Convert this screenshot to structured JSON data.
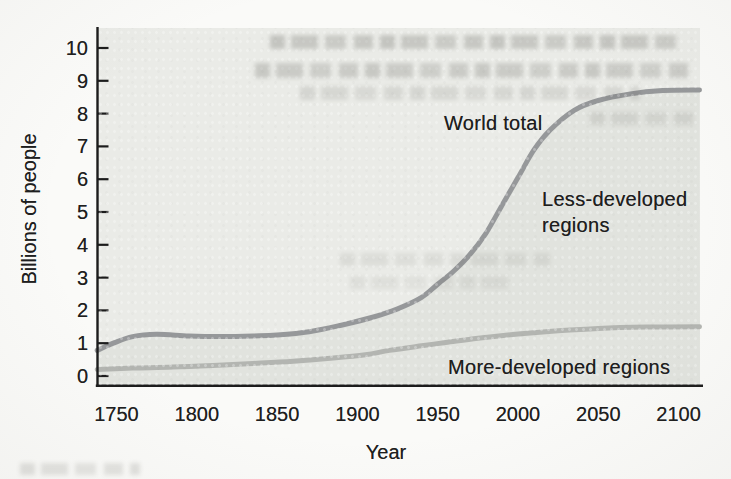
{
  "figure": {
    "y_axis_label": "Billions of people",
    "x_axis_label": "Year",
    "labels": {
      "world_total": "World total",
      "less_developed_line1": "Less-developed",
      "less_developed_line2": "regions",
      "more_developed": "More-developed regions"
    }
  },
  "colors": {
    "paper": "#fafaf8",
    "plot_background": "#eaebe7",
    "shaded_area_under_world_total": "#e1e3de",
    "world_total_curve": "#96989a",
    "more_developed_curve": "#b3b5b1",
    "axis_ink": "#1c1c1c",
    "text_ink": "#1e1e1e"
  },
  "chart_data": {
    "type": "line",
    "title": "",
    "xlabel": "Year",
    "ylabel": "Billions of people",
    "xlim": [
      1738,
      2113
    ],
    "ylim": [
      0,
      10.6
    ],
    "x_ticks": [
      1750,
      1800,
      1850,
      1900,
      1950,
      2000,
      2050,
      2100
    ],
    "y_ticks": [
      0,
      1,
      2,
      3,
      4,
      5,
      6,
      7,
      8,
      9,
      10
    ],
    "grid": false,
    "legend_position": "inline area labels",
    "series": [
      {
        "name": "World total",
        "style": "medium-gray curve, area below shaded",
        "points": [
          [
            1738,
            0.78
          ],
          [
            1748,
            1.0
          ],
          [
            1760,
            1.2
          ],
          [
            1775,
            1.27
          ],
          [
            1795,
            1.22
          ],
          [
            1815,
            1.2
          ],
          [
            1835,
            1.22
          ],
          [
            1850,
            1.25
          ],
          [
            1870,
            1.35
          ],
          [
            1890,
            1.55
          ],
          [
            1910,
            1.8
          ],
          [
            1925,
            2.05
          ],
          [
            1940,
            2.4
          ],
          [
            1950,
            2.8
          ],
          [
            1960,
            3.2
          ],
          [
            1970,
            3.7
          ],
          [
            1980,
            4.35
          ],
          [
            1990,
            5.2
          ],
          [
            2000,
            6.05
          ],
          [
            2010,
            6.9
          ],
          [
            2020,
            7.5
          ],
          [
            2035,
            8.1
          ],
          [
            2050,
            8.4
          ],
          [
            2070,
            8.6
          ],
          [
            2090,
            8.7
          ],
          [
            2113,
            8.72
          ]
        ]
      },
      {
        "name": "More-developed regions",
        "style": "light-gray curve",
        "points": [
          [
            1738,
            0.2
          ],
          [
            1760,
            0.24
          ],
          [
            1785,
            0.27
          ],
          [
            1810,
            0.32
          ],
          [
            1835,
            0.38
          ],
          [
            1860,
            0.45
          ],
          [
            1885,
            0.55
          ],
          [
            1905,
            0.65
          ],
          [
            1920,
            0.78
          ],
          [
            1940,
            0.92
          ],
          [
            1955,
            1.02
          ],
          [
            1975,
            1.15
          ],
          [
            2000,
            1.28
          ],
          [
            2025,
            1.38
          ],
          [
            2050,
            1.45
          ],
          [
            2080,
            1.49
          ],
          [
            2113,
            1.5
          ]
        ]
      }
    ],
    "area_labels": [
      {
        "text": "World total",
        "refers_to": "upper curve",
        "position": "left of steep rise, ~y 7.9"
      },
      {
        "text": "Less-developed regions",
        "refers_to": "area between curves",
        "position": "center-right, ~y 5"
      },
      {
        "text": "More-developed regions",
        "refers_to": "lower curve",
        "position": "bottom-right, below lower curve"
      }
    ]
  }
}
